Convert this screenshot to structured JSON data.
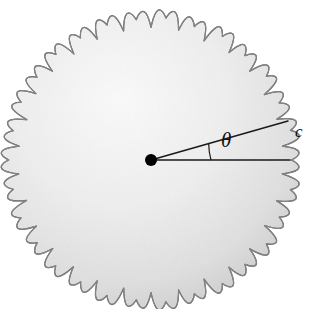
{
  "figure": {
    "name": "scalloped-circle-sector-diagram",
    "width": 313,
    "height": 309,
    "background_color": "#ffffff"
  },
  "labels": {
    "theta": "θ",
    "arc_length": "c"
  },
  "colors": {
    "fill_light": "#fcfcfc",
    "fill_mid": "#f2f2f2",
    "fill_shadow": "#e6e6e6",
    "outline": "#9a9a9a",
    "outline_dark": "#7d7d7d",
    "line": "#1a1a1a",
    "center_dot": "#000000"
  },
  "chart_data": {
    "type": "diagram",
    "title": "",
    "shape": {
      "kind": "scalloped-circle",
      "center": [
        151,
        160
      ],
      "radius": 139,
      "scallop_count": 30,
      "scallop_depth": 7
    },
    "elements": [
      {
        "name": "center-point",
        "kind": "point",
        "x": 151,
        "y": 160,
        "radius_px": 6
      },
      {
        "name": "radius-lower",
        "kind": "segment",
        "from": [
          151,
          160
        ],
        "to": [
          290,
          160
        ],
        "angle_deg": 0
      },
      {
        "name": "radius-upper",
        "kind": "segment",
        "from": [
          151,
          160
        ],
        "to": [
          288,
          121
        ],
        "angle_deg": 15.9
      },
      {
        "name": "angle-arc",
        "kind": "arc",
        "center": [
          151,
          160
        ],
        "radius_px": 60,
        "start_angle_deg": 0,
        "end_angle_deg": 15.9,
        "label": "θ"
      },
      {
        "name": "arc-c",
        "kind": "arc",
        "center": [
          151,
          160
        ],
        "radius_px": 139,
        "start_angle_deg": 0,
        "end_angle_deg": 15.9,
        "label": "c"
      }
    ],
    "annotations": [
      {
        "text": "θ",
        "x": 228,
        "y": 145,
        "style": "italic-serif"
      },
      {
        "text": "c",
        "x": 299,
        "y": 135,
        "style": "italic-serif"
      }
    ],
    "xlabel": "",
    "ylabel": "",
    "legend": []
  }
}
